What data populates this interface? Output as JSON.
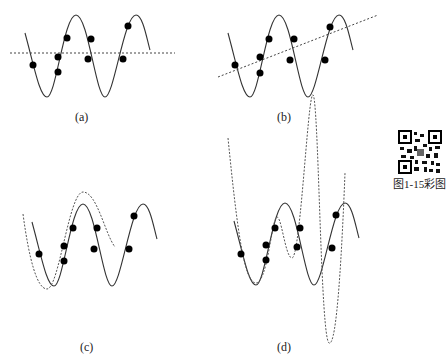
{
  "figure": {
    "caption_link": "图1-15彩图",
    "panels": [
      {
        "id": "a",
        "label": "(a)",
        "fit": "constant (horizontal line)"
      },
      {
        "id": "b",
        "label": "(b)",
        "fit": "linear (sloped line)"
      },
      {
        "id": "c",
        "label": "(c)",
        "fit": "good fit curve"
      },
      {
        "id": "d",
        "label": "(d)",
        "fit": "overfit high-order curve"
      }
    ]
  },
  "colors": {
    "curve": "#333333",
    "fit": "#555555",
    "points": "#000000"
  }
}
